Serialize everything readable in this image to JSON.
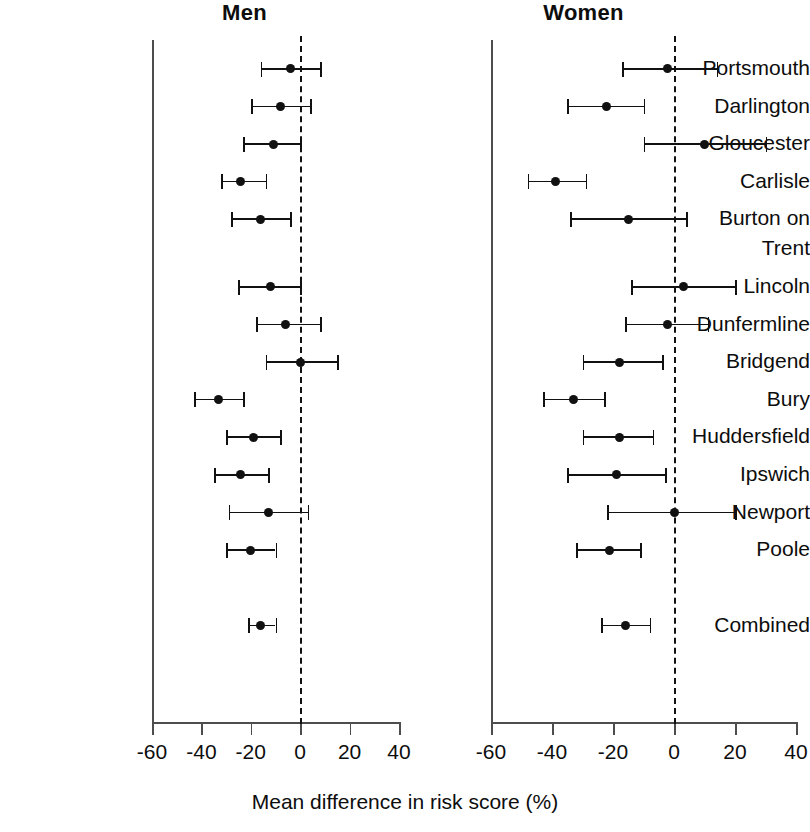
{
  "figure": {
    "x_axis_caption": "Mean difference in risk score (%)",
    "panels": [
      {
        "key": "men",
        "title": "Men"
      },
      {
        "key": "women",
        "title": "Women"
      }
    ]
  },
  "chart_data": {
    "type": "scatter",
    "subtype": "forest-plot",
    "title": "",
    "xlabel": "Mean difference in risk score (%)",
    "ylabel": "",
    "xlim": [
      -60,
      40
    ],
    "xticks": [
      -60,
      -40,
      -20,
      0,
      20,
      40
    ],
    "xticklabels": [
      "-60",
      "-40",
      "-20",
      "0",
      "20",
      "40"
    ],
    "grid": false,
    "reference_line": 0,
    "reference_line_style": "dashed",
    "legend": "none",
    "panels": [
      "Men",
      "Women"
    ],
    "categories": [
      "Portsmouth",
      "Darlington",
      "Gloucester",
      "Carlisle",
      "Burton on Trent",
      "Lincoln",
      "Dunfermline",
      "Bridgend",
      "Bury",
      "Huddersfield",
      "Ipswich",
      "Newport",
      "Poole",
      "Combined"
    ],
    "category_labels": [
      {
        "lines": [
          "Portsmouth"
        ]
      },
      {
        "lines": [
          "Darlington"
        ]
      },
      {
        "lines": [
          "Gloucester"
        ]
      },
      {
        "lines": [
          "Carlisle"
        ]
      },
      {
        "lines": [
          "Burton on",
          "Trent"
        ]
      },
      {
        "lines": [
          "Lincoln"
        ]
      },
      {
        "lines": [
          "Dunfermline"
        ]
      },
      {
        "lines": [
          "Bridgend"
        ]
      },
      {
        "lines": [
          "Bury"
        ]
      },
      {
        "lines": [
          "Huddersfield"
        ]
      },
      {
        "lines": [
          "Ipswich"
        ]
      },
      {
        "lines": [
          "Newport"
        ]
      },
      {
        "lines": [
          "Poole"
        ]
      },
      {
        "lines": [
          "Combined"
        ]
      }
    ],
    "series": [
      {
        "name": "Men",
        "points": [
          {
            "category": "Portsmouth",
            "mean": -4,
            "low": -16,
            "high": 8
          },
          {
            "category": "Darlington",
            "mean": -8,
            "low": -20,
            "high": 4
          },
          {
            "category": "Gloucester",
            "mean": -11,
            "low": -23,
            "high": 0
          },
          {
            "category": "Carlisle",
            "mean": -24,
            "low": -32,
            "high": -14
          },
          {
            "category": "Burton on Trent",
            "mean": -16,
            "low": -28,
            "high": -4
          },
          {
            "category": "Lincoln",
            "mean": -12,
            "low": -25,
            "high": 0
          },
          {
            "category": "Dunfermline",
            "mean": -6,
            "low": -18,
            "high": 8
          },
          {
            "category": "Bridgend",
            "mean": 0,
            "low": -14,
            "high": 15
          },
          {
            "category": "Bury",
            "mean": -33,
            "low": -43,
            "high": -23
          },
          {
            "category": "Huddersfield",
            "mean": -19,
            "low": -30,
            "high": -8
          },
          {
            "category": "Ipswich",
            "mean": -24,
            "low": -35,
            "high": -13
          },
          {
            "category": "Newport",
            "mean": -13,
            "low": -29,
            "high": 3
          },
          {
            "category": "Poole",
            "mean": -20,
            "low": -30,
            "high": -10
          },
          {
            "category": "Combined",
            "mean": -16,
            "low": -21,
            "high": -10
          }
        ]
      },
      {
        "name": "Women",
        "points": [
          {
            "category": "Portsmouth",
            "mean": -2,
            "low": -17,
            "high": 14
          },
          {
            "category": "Darlington",
            "mean": -22,
            "low": -35,
            "high": -10
          },
          {
            "category": "Gloucester",
            "mean": 10,
            "low": -10,
            "high": 30
          },
          {
            "category": "Carlisle",
            "mean": -39,
            "low": -48,
            "high": -29
          },
          {
            "category": "Burton on Trent",
            "mean": -15,
            "low": -34,
            "high": 4
          },
          {
            "category": "Lincoln",
            "mean": 3,
            "low": -14,
            "high": 20
          },
          {
            "category": "Dunfermline",
            "mean": -2,
            "low": -16,
            "high": 11
          },
          {
            "category": "Bridgend",
            "mean": -18,
            "low": -30,
            "high": -4
          },
          {
            "category": "Bury",
            "mean": -33,
            "low": -43,
            "high": -23
          },
          {
            "category": "Huddersfield",
            "mean": -18,
            "low": -30,
            "high": -7
          },
          {
            "category": "Ipswich",
            "mean": -19,
            "low": -35,
            "high": -3
          },
          {
            "category": "Newport",
            "mean": 0,
            "low": -22,
            "high": 20
          },
          {
            "category": "Poole",
            "mean": -21,
            "low": -32,
            "high": -11
          },
          {
            "category": "Combined",
            "mean": -16,
            "low": -24,
            "high": -8
          }
        ]
      }
    ]
  },
  "colors": {
    "marker": "#111111",
    "axis": "#4d4d4d",
    "text": "#0d0d0d",
    "background": "#ffffff"
  }
}
